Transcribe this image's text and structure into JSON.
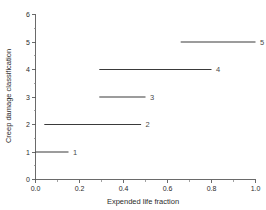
{
  "chart_data": {
    "type": "line",
    "title": "",
    "xlabel": "Expended life fraction",
    "ylabel": "Creep damage classification",
    "xlim": [
      0.0,
      1.0
    ],
    "ylim": [
      0,
      6
    ],
    "grid": false,
    "legend": "none",
    "xticks": [
      "0.0",
      "0.2",
      "0.4",
      "0.6",
      "0.8",
      "1.0"
    ],
    "xtick_values": [
      0.0,
      0.2,
      0.4,
      0.6,
      0.8,
      1.0
    ],
    "xminor_values": [
      0.1,
      0.3,
      0.5,
      0.7,
      0.9
    ],
    "yticks": [
      "0",
      "1",
      "2",
      "3",
      "4",
      "5",
      "6"
    ],
    "ytick_values": [
      0,
      1,
      2,
      3,
      4,
      5,
      6
    ],
    "yminor_values": [
      0.5,
      1.5,
      2.5,
      3.5,
      4.5,
      5.5
    ],
    "series": [
      {
        "name": "1",
        "label": "1",
        "y": 1,
        "x_start": 0.0,
        "x_end": 0.15
      },
      {
        "name": "2",
        "label": "2",
        "y": 2,
        "x_start": 0.04,
        "x_end": 0.48
      },
      {
        "name": "3",
        "label": "3",
        "y": 3,
        "x_start": 0.29,
        "x_end": 0.5
      },
      {
        "name": "4",
        "label": "4",
        "y": 4,
        "x_start": 0.29,
        "x_end": 0.8
      },
      {
        "name": "5",
        "label": "5",
        "y": 5,
        "x_start": 0.66,
        "x_end": 1.0
      }
    ],
    "colors": {
      "line": "#3a3a3a",
      "axis": "#5a5a5a",
      "text": "#2b2b2b",
      "background": "#ffffff"
    }
  }
}
